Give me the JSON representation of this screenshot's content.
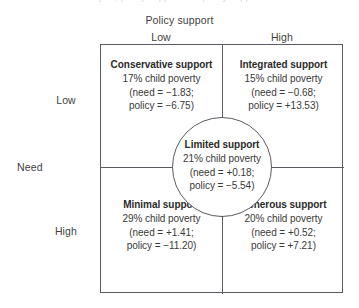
{
  "figure": {
    "clipped_top_text": "in the the cluster analysis, policy support and policy support",
    "axes": {
      "top_title": "Policy support",
      "left_title": "Need",
      "column_labels": [
        "Low",
        "High"
      ],
      "row_labels": [
        "Low",
        "High"
      ]
    },
    "cells": {
      "top_left": {
        "title": "Conservative support",
        "poverty": "17% child poverty",
        "need_line": "(need = −1.83;",
        "policy_line": "policy = −6.75)",
        "need_value": -1.83,
        "policy_value": -6.75,
        "child_poverty_pct": 17
      },
      "top_right": {
        "title": "Integrated support",
        "poverty": "15% child poverty",
        "need_line": "(need = −0.68;",
        "policy_line": "policy = +13.53)",
        "need_value": -0.68,
        "policy_value": 13.53,
        "child_poverty_pct": 15
      },
      "center": {
        "title": "Limited support",
        "poverty": "21% child poverty",
        "need_line": "(need = +0.18;",
        "policy_line": "policy = −5.54)",
        "need_value": 0.18,
        "policy_value": -5.54,
        "child_poverty_pct": 21
      },
      "bottom_left": {
        "title": "Minimal support",
        "poverty": "29% child poverty",
        "need_line": "(need = +1.41;",
        "policy_line": "policy = −11.20)",
        "need_value": 1.41,
        "policy_value": -11.2,
        "child_poverty_pct": 29
      },
      "bottom_right": {
        "title": "Generous support",
        "poverty": "20% child poverty",
        "need_line": "(need = +0.52;",
        "policy_line": "policy = +7.21)",
        "need_value": 0.52,
        "policy_value": 7.21,
        "child_poverty_pct": 20
      }
    },
    "colors": {
      "line": "#5a5a63",
      "text": "#3a3a3a",
      "title_text": "#2b2b2b",
      "background": "#ffffff"
    }
  },
  "chart_data": {
    "type": "scatter",
    "title": "",
    "xlabel": "Policy support",
    "ylabel": "Need",
    "xticklabels": [
      "Low",
      "High"
    ],
    "yticklabels": [
      "Low",
      "High"
    ],
    "grid": false,
    "legend": "none",
    "annotations": [
      {
        "label": "Conservative support",
        "quadrant": "low need / low policy support",
        "need": -1.83,
        "policy": -6.75,
        "child_poverty_pct": 17
      },
      {
        "label": "Integrated support",
        "quadrant": "low need / high policy support",
        "need": -0.68,
        "policy": 13.53,
        "child_poverty_pct": 15
      },
      {
        "label": "Limited support",
        "quadrant": "center",
        "need": 0.18,
        "policy": -5.54,
        "child_poverty_pct": 21
      },
      {
        "label": "Minimal support",
        "quadrant": "high need / low policy support",
        "need": 1.41,
        "policy": -11.2,
        "child_poverty_pct": 29
      },
      {
        "label": "Generous support",
        "quadrant": "high need / high policy support",
        "need": 0.52,
        "policy": 7.21,
        "child_poverty_pct": 20
      }
    ]
  }
}
